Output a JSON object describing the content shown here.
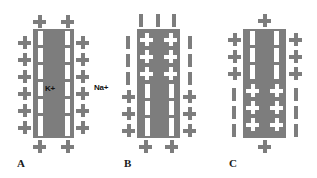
{
  "figure": {
    "background_color": "#ffffff",
    "gray_color": "#7d7d7d",
    "white_color": "#ffffff",
    "text_color": "#1a1a1a",
    "width": 317,
    "height": 178
  },
  "ion_labels": {
    "potassium": "K+",
    "sodium": "Na+"
  },
  "panels": [
    {
      "letter": "A",
      "name": "panel-a",
      "description": "Resting membrane: gray charges outside on both sides and at top and bottom, K+ inside, Na+ outside, two dashed white channel columns",
      "inside_label": "K+",
      "outside_label": "Na+",
      "top_charges": 2,
      "bottom_charges": 2,
      "left_charges": 6,
      "right_charges": 6,
      "inner_marks": "dashes",
      "outer_marks": "plus"
    },
    {
      "letter": "B",
      "name": "panel-b",
      "description": "Depolarizing upper region: white plus signs inside upper membrane, gray dashes at top and flanking upper sides, gray plus signs at lower sides and bottom",
      "top_charges": 3,
      "bottom_charges": 2,
      "left_charges": 3,
      "right_charges": 3,
      "left_dashes": 3,
      "right_dashes": 3,
      "inner_marks": "plus-upper-dash-lower",
      "outer_marks": "dash-upper-plus-lower"
    },
    {
      "letter": "C",
      "name": "panel-c",
      "description": "Depolarizing lower region: white plus signs inside lower membrane, gray plus signs at top and flanking upper sides, gray dashes flanking lower sides",
      "top_charges": 1,
      "bottom_charges": 1,
      "left_charges": 3,
      "right_charges": 3,
      "left_dashes": 3,
      "right_dashes": 3,
      "inner_marks": "dash-upper-plus-lower",
      "outer_marks": "plus-upper-dash-lower"
    }
  ]
}
